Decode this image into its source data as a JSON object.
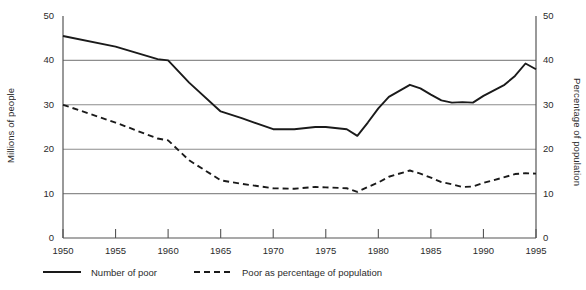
{
  "chart_data": {
    "type": "line",
    "title": "",
    "subtitle": "",
    "xlabel": "",
    "ylabel": "Millions of people",
    "y2label": "Percentage of population",
    "xlim": [
      1950,
      1995
    ],
    "ylim": [
      0,
      50
    ],
    "y2lim": [
      0,
      50
    ],
    "grid": true,
    "grid_values": [
      10,
      20,
      30,
      40
    ],
    "legend_position": "below",
    "xticks": [
      "1950",
      "1955",
      "1960",
      "1965",
      "1970",
      "1975",
      "1980",
      "1985",
      "1990",
      "1995"
    ],
    "xtick_values": [
      1950,
      1955,
      1960,
      1965,
      1970,
      1975,
      1980,
      1985,
      1990,
      1995
    ],
    "yticks": [
      "0",
      "10",
      "20",
      "30",
      "40",
      "50"
    ],
    "ytick_values": [
      0,
      10,
      20,
      30,
      40,
      50
    ],
    "y2ticks": [
      "0",
      "10",
      "20",
      "30",
      "40",
      "50"
    ],
    "y2tick_values": [
      0,
      10,
      20,
      30,
      40,
      50
    ],
    "series": [
      {
        "name": "Number of poor",
        "axis": "left",
        "style": "solid",
        "color": "#1a1a1a",
        "x": [
          1950,
          1955,
          1959,
          1960,
          1962,
          1965,
          1967,
          1970,
          1972,
          1974,
          1975,
          1977,
          1978,
          1979,
          1980,
          1981,
          1983,
          1984,
          1985,
          1986,
          1987,
          1988,
          1989,
          1990,
          1992,
          1993,
          1994,
          1995
        ],
        "values": [
          45.5,
          43.1,
          40.3,
          40.0,
          35.0,
          28.5,
          27.0,
          24.5,
          24.5,
          25.0,
          25.0,
          24.5,
          23.0,
          26.0,
          29.2,
          31.8,
          34.5,
          33.7,
          32.3,
          31.0,
          30.5,
          30.6,
          30.5,
          32.0,
          34.5,
          36.5,
          39.3,
          38.0
        ]
      },
      {
        "name": "Poor as percentage of population",
        "axis": "right",
        "style": "dashed",
        "color": "#1a1a1a",
        "x": [
          1950,
          1955,
          1959,
          1960,
          1962,
          1965,
          1967,
          1970,
          1972,
          1974,
          1975,
          1977,
          1978,
          1979,
          1980,
          1981,
          1983,
          1984,
          1985,
          1986,
          1987,
          1988,
          1989,
          1990,
          1992,
          1993,
          1994,
          1995
        ],
        "values": [
          30.0,
          26.0,
          22.4,
          22.0,
          17.5,
          13.0,
          12.2,
          11.2,
          11.1,
          11.5,
          11.4,
          11.2,
          10.4,
          11.5,
          12.5,
          13.8,
          15.2,
          14.5,
          13.6,
          12.6,
          12.1,
          11.5,
          11.6,
          12.4,
          13.7,
          14.4,
          14.6,
          14.5
        ]
      }
    ]
  },
  "axes": {
    "left_title": "Millions of people",
    "right_title": "Percentage of population"
  },
  "legend": {
    "items": [
      {
        "label": "Number of poor",
        "style": "solid",
        "icon": "solid-line-icon"
      },
      {
        "label": "Poor as percentage of population",
        "style": "dashed",
        "icon": "dashed-line-icon"
      }
    ]
  }
}
